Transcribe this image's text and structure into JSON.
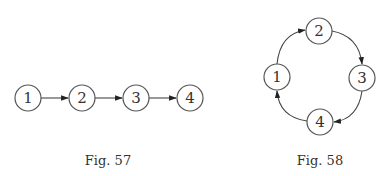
{
  "figures": [
    {
      "id": "fig57",
      "caption": "Fig. 57",
      "type": "path-graph",
      "nodes": [
        {
          "label": "1",
          "x": 28,
          "y": 98
        },
        {
          "label": "2",
          "x": 82,
          "y": 98
        },
        {
          "label": "3",
          "x": 136,
          "y": 98
        },
        {
          "label": "4",
          "x": 190,
          "y": 98
        }
      ],
      "edges": [
        {
          "from": "1",
          "to": "2"
        },
        {
          "from": "2",
          "to": "3"
        },
        {
          "from": "3",
          "to": "4"
        }
      ]
    },
    {
      "id": "fig58",
      "caption": "Fig. 58",
      "type": "cycle-graph",
      "nodes": [
        {
          "label": "1",
          "x": 277,
          "y": 77
        },
        {
          "label": "2",
          "x": 319,
          "y": 31
        },
        {
          "label": "3",
          "x": 362,
          "y": 78
        },
        {
          "label": "4",
          "x": 320,
          "y": 122
        }
      ],
      "edges": [
        {
          "from": "1",
          "to": "2"
        },
        {
          "from": "2",
          "to": "3"
        },
        {
          "from": "3",
          "to": "4"
        },
        {
          "from": "4",
          "to": "1"
        }
      ]
    }
  ]
}
